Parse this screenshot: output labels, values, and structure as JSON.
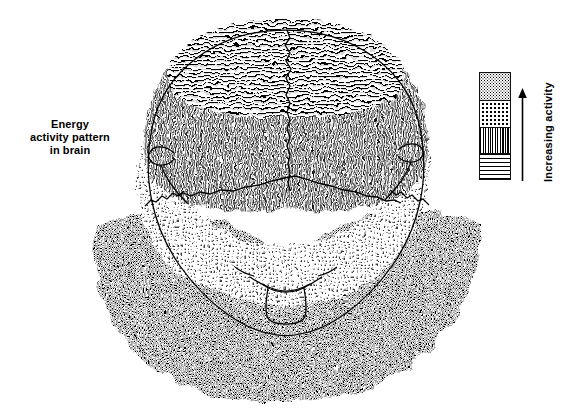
{
  "figure": {
    "caption_lines": [
      "Energy",
      "activity pattern",
      "in brain"
    ],
    "background_color": "#ffffff",
    "ink_color": "#000000"
  },
  "legend": {
    "title": "Increasing activity",
    "arrow_direction": "up",
    "arrow_icon": "up-arrow-icon",
    "bands_top_to_bottom": [
      {
        "name": "dense-stipple",
        "pattern": "dense stipple",
        "activity": "highest"
      },
      {
        "name": "sparse-dots",
        "pattern": "sparse dots",
        "activity": "high"
      },
      {
        "name": "vertical-wavy",
        "pattern": "vertical wavy lines",
        "activity": "medium"
      },
      {
        "name": "horizontal-lines",
        "pattern": "horizontal lines",
        "activity": "lowest"
      }
    ]
  },
  "diagram": {
    "regions": [
      {
        "name": "frontal-region",
        "pattern": "horizontal lines",
        "activity": "lowest"
      },
      {
        "name": "cerebral-cortex-region",
        "pattern": "vertical wavy lines",
        "activity": "medium"
      },
      {
        "name": "mid-surround-region",
        "pattern": "sparse dots",
        "activity": "high"
      },
      {
        "name": "lower-halo-region",
        "pattern": "dense stipple",
        "activity": "highest"
      }
    ],
    "outline_features": [
      "skull-outline",
      "midline-suture",
      "left-ear-hook",
      "right-ear-hook",
      "temporal-boundary",
      "foramen-magnum",
      "brainstem-outline"
    ]
  }
}
